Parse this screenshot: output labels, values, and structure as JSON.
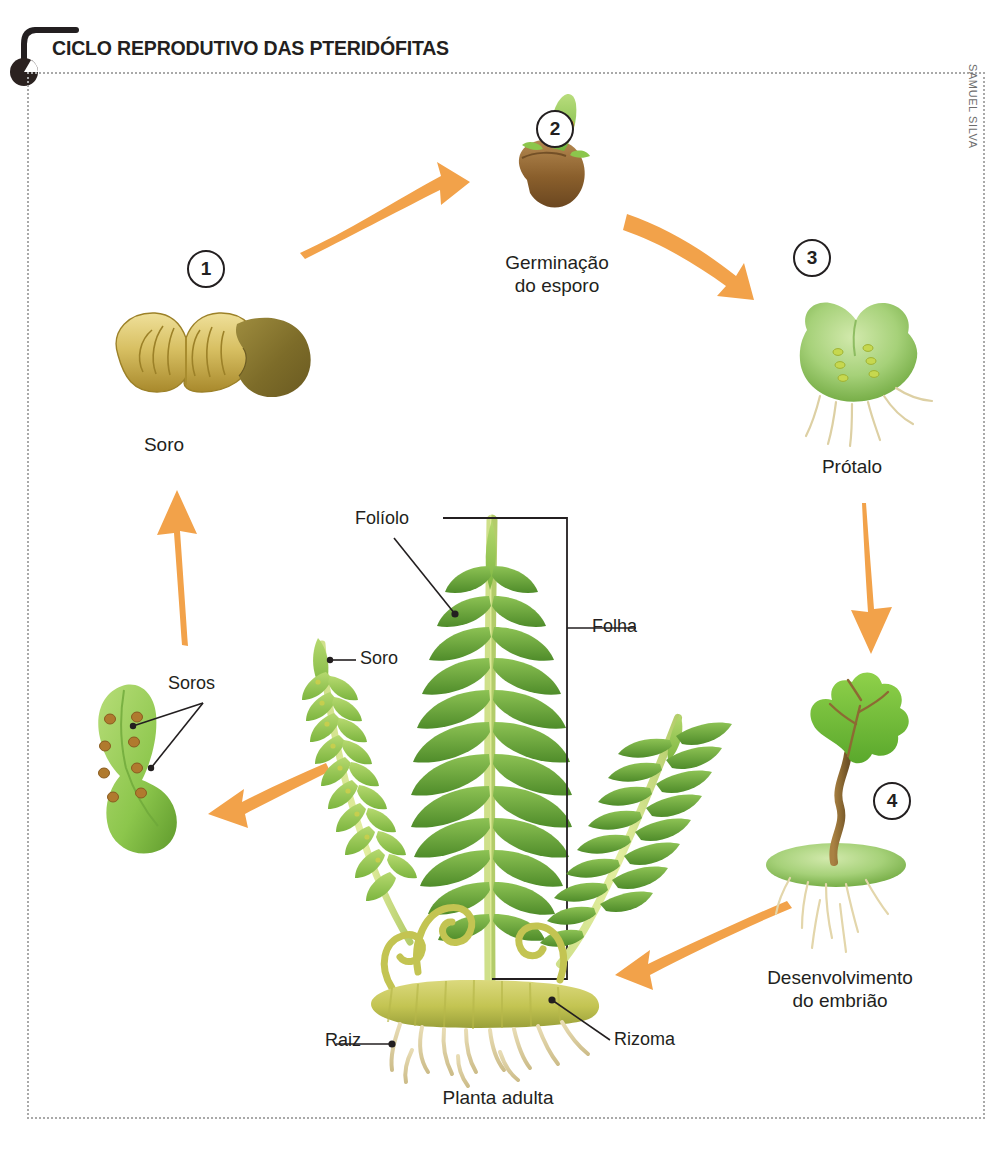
{
  "title": "CICLO REPRODUTIVO DAS PTERIDÓFITAS",
  "credit": "SAMUEL SILVA",
  "colors": {
    "arrow": "#F2A24A",
    "ink": "#231f20",
    "frame": "#a9a9a9",
    "leaf_green": "#7ab648",
    "leaf_green_dark": "#5d9733",
    "prothallus_green": "#9ecf7a",
    "spore_brown": "#8a6030",
    "sorus_gold": "#c8a838",
    "rhizome_olive": "#c3c452",
    "root_tan": "#e6d9ae"
  },
  "steps": [
    {
      "number": "1",
      "caption": "Soro",
      "name": "sorus"
    },
    {
      "number": "2",
      "caption": "Germinação\ndo esporo",
      "name": "spore-germination"
    },
    {
      "number": "3",
      "caption": "Prótalo",
      "name": "prothallus"
    },
    {
      "number": "4",
      "caption": "Desenvolvimento\ndo embrião",
      "name": "embryo-development"
    }
  ],
  "plant": {
    "caption": "Planta adulta",
    "parts": [
      {
        "key": "foliolo",
        "label": "Folíolo"
      },
      {
        "key": "folha",
        "label": "Folha"
      },
      {
        "key": "soro",
        "label": "Soro"
      },
      {
        "key": "raiz",
        "label": "Raiz"
      },
      {
        "key": "rizoma",
        "label": "Rizoma"
      }
    ]
  },
  "soros_detail": {
    "label": "Soros"
  },
  "arrows": [
    {
      "name": "arrow-sorus-to-germination",
      "direction": "right-up"
    },
    {
      "name": "arrow-germination-to-prothallus",
      "direction": "right-down"
    },
    {
      "name": "arrow-prothallus-to-embryo",
      "direction": "down"
    },
    {
      "name": "arrow-embryo-to-plant",
      "direction": "left"
    },
    {
      "name": "arrow-plant-to-soros",
      "direction": "left"
    },
    {
      "name": "arrow-soros-to-sorus",
      "direction": "up"
    }
  ]
}
